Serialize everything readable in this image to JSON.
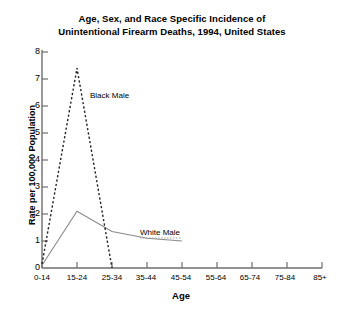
{
  "chart_data": {
    "type": "line",
    "title": "Age, Sex, and Race Specific Incidence of Unintentional Firearm Deaths, 1994, United States",
    "title_line1": "Age, Sex, and Race Specific Incidence of",
    "title_line2": "Unintentional Firearm Deaths, 1994, United States",
    "xlabel": "Age",
    "ylabel": "Rate per 100,000 Population",
    "categories": [
      "0-14",
      "15-24",
      "25-34",
      "35-44",
      "45-54",
      "55-64",
      "65-74",
      "75-84",
      "85+"
    ],
    "ylim": [
      0,
      8
    ],
    "yticks": [
      "0",
      "1",
      "2",
      "3",
      "4",
      "5",
      "6",
      "7",
      "8"
    ],
    "grid": false,
    "legend_position": "inline-annotation",
    "series": [
      {
        "name": "Black Male",
        "style": "dashed",
        "color": "#222222",
        "values": [
          0.15,
          7.4,
          0.0,
          null,
          null,
          null,
          null,
          null,
          null
        ],
        "label_x": 90,
        "label_y": 91
      },
      {
        "name": "White Male",
        "style": "solid",
        "color": "#8a8a8a",
        "values": [
          0.1,
          2.1,
          1.35,
          1.1,
          1.0,
          null,
          null,
          null,
          null
        ],
        "label_x": 140,
        "label_y": 228
      }
    ]
  },
  "axes": {
    "y_tick_labels": [
      "8",
      "7",
      "6",
      "5",
      "4",
      "3",
      "2",
      "1",
      "0"
    ],
    "x_tick_labels": [
      "0-14",
      "15-24",
      "25-34",
      "35-44",
      "45-54",
      "55-64",
      "65-74",
      "75-84",
      "85+"
    ]
  }
}
